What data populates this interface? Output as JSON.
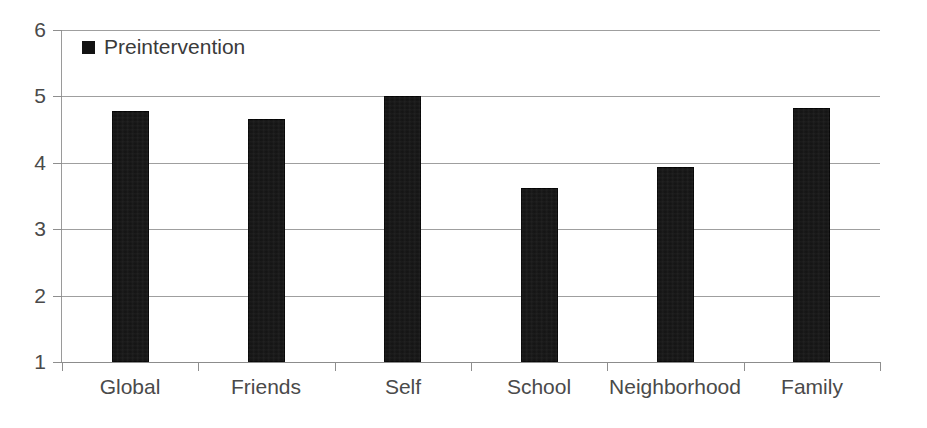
{
  "chart_data": {
    "type": "bar",
    "title": "",
    "xlabel": "",
    "ylabel": "",
    "ylim": [
      1,
      6
    ],
    "yticks": [
      1,
      2,
      3,
      4,
      5,
      6
    ],
    "grid": true,
    "legend_position": "top-left",
    "categories": [
      "Global",
      "Friends",
      "Self",
      "School",
      "Neighborhood",
      "Family"
    ],
    "series": [
      {
        "name": "Preintervention",
        "color": "#121212",
        "values": [
          4.78,
          4.66,
          5.0,
          3.62,
          3.93,
          4.83
        ]
      }
    ]
  },
  "legend": {
    "entries": [
      {
        "label": "Preintervention",
        "marker": "filled-square"
      }
    ]
  },
  "axes": {
    "y": {
      "ticks": [
        "6",
        "5",
        "4",
        "3",
        "2",
        "1"
      ]
    }
  }
}
